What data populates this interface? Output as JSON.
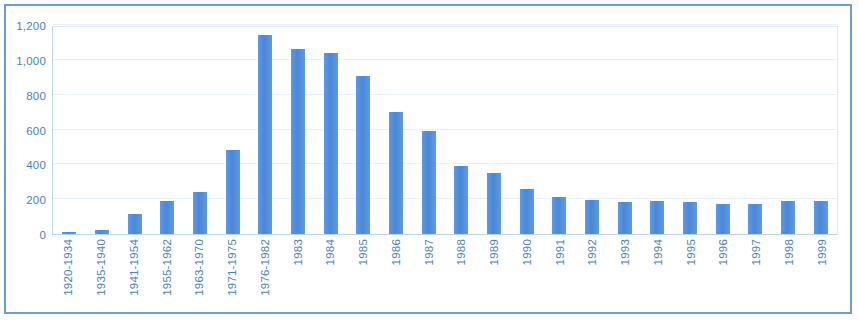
{
  "chart_data": {
    "type": "bar",
    "title": "",
    "subtitle": "",
    "xlabel": "",
    "ylabel": "",
    "ylim": [
      0,
      1200
    ],
    "ytick_labels": [
      "0",
      "200",
      "400",
      "600",
      "800",
      "1,000",
      "1,200"
    ],
    "yticks": [
      0,
      200,
      400,
      600,
      800,
      1000,
      1200
    ],
    "grid": true,
    "legend": null,
    "legend_position": "none",
    "bar_color": "#4f8fdc",
    "axis_text_color": "#4a7fc1",
    "frame_color": "#6c9fd8",
    "gridline_color": "#e8f1f9",
    "categories": [
      "1920-1934",
      "1935-1940",
      "1941-1954",
      "1955-1962",
      "1963-1970",
      "1971-1975",
      "1976-1982",
      "1983",
      "1984",
      "1985",
      "1986",
      "1987",
      "1988",
      "1989",
      "1990",
      "1991",
      "1992",
      "1993",
      "1994",
      "1995",
      "1996",
      "1997",
      "1998",
      "1999"
    ],
    "values": [
      12,
      25,
      115,
      190,
      240,
      485,
      1140,
      1065,
      1040,
      905,
      700,
      590,
      390,
      350,
      260,
      210,
      195,
      185,
      190,
      185,
      170,
      170,
      190,
      190
    ]
  }
}
